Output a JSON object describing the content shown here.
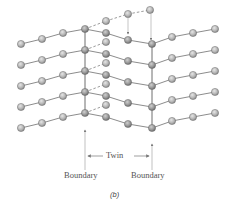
{
  "figure": {
    "caption": "(b)",
    "labels": {
      "twin": "Twin",
      "boundary_left": "Boundary",
      "boundary_right": "Boundary"
    },
    "colors": {
      "atom_fill": "#bdbdbd",
      "atom_stroke": "#6a6a6a",
      "bond": "#6e6e6e",
      "arrow": "#8a8a8a",
      "text": "#555555"
    }
  },
  "lattice": {
    "description": "Twin boundary in a crystal lattice: parent lattice on both sides, mirrored twin region between two boundaries",
    "left_boundary_x": 85,
    "right_boundary_x": 152,
    "rows": 5,
    "left_atoms_per_row": 4,
    "right_atoms_per_row": 4,
    "twin_atoms_per_row": 2
  }
}
